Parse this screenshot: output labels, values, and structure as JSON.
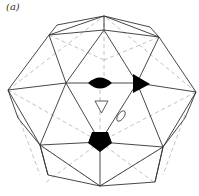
{
  "figure": {
    "panel_label": "(a)",
    "symbols": [
      {
        "name": "two-fold-axis",
        "shape": "lens",
        "fill": "#000000"
      },
      {
        "name": "three-fold-axis",
        "shape": "triangle",
        "fill": "#000000"
      },
      {
        "name": "five-fold-axis",
        "shape": "pentagon",
        "fill": "#000000"
      },
      {
        "name": "inversion-three-fold",
        "shape": "open-triangle",
        "fill": "#ffffff"
      },
      {
        "name": "two-fold-open",
        "shape": "small-ellipse",
        "fill": "#ffffff"
      }
    ],
    "colors": {
      "edge": "#333333",
      "hidden_edge": "#bbbbbb",
      "symbol": "#000000"
    }
  }
}
